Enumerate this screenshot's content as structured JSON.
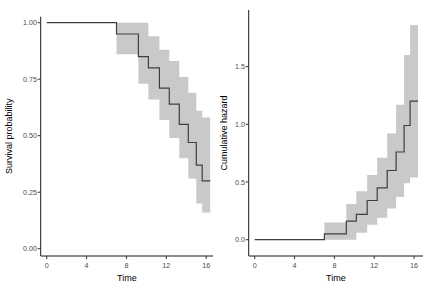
{
  "figure": {
    "width": 436,
    "height": 294,
    "background": "#ffffff"
  },
  "colors": {
    "curve": "#3f3f3f",
    "ribbon": "#c9c9c9",
    "axis_line": "#1a1a1a",
    "tick_mark": "#333333",
    "tick_label": "#4d4d4d",
    "axis_title": "#000000"
  },
  "chart_data": [
    {
      "type": "line",
      "subtype": "kaplan-meier-step",
      "panel": "left",
      "title": "",
      "xlabel": "Time",
      "ylabel": "Survival probability",
      "grid": false,
      "legend": "none",
      "xlim": [
        -0.7,
        16.6
      ],
      "ylim": [
        -0.03,
        1.03
      ],
      "x_tick_values": [
        0,
        4,
        8,
        12,
        16
      ],
      "x_tick_labels": [
        "0",
        "4",
        "8",
        "12",
        "16"
      ],
      "y_tick_values": [
        0.0,
        0.25,
        0.5,
        0.75,
        1.0
      ],
      "y_tick_labels": [
        "0.00",
        "0.25",
        "0.50",
        "0.75",
        "1.00"
      ],
      "start_time": 0,
      "start_value": 1.0,
      "event_times": [
        7.0,
        9.2,
        10.2,
        11.3,
        12.3,
        13.3,
        14.2,
        15.0,
        15.6
      ],
      "values_after_event": [
        0.95,
        0.85,
        0.8,
        0.71,
        0.64,
        0.55,
        0.47,
        0.37,
        0.3
      ],
      "curve_end_time": 16.4,
      "ci_upper": [
        1.0,
        1.0,
        0.94,
        0.88,
        0.83,
        0.76,
        0.69,
        0.61,
        0.58
      ],
      "ci_lower": [
        0.86,
        0.73,
        0.66,
        0.57,
        0.49,
        0.4,
        0.31,
        0.2,
        0.16
      ]
    },
    {
      "type": "line",
      "subtype": "cumulative-hazard-step",
      "panel": "right",
      "title": "",
      "xlabel": "Time",
      "ylabel": "Cumulative hazard",
      "grid": false,
      "legend": "none",
      "xlim": [
        -0.7,
        16.6
      ],
      "ylim": [
        -0.095,
        1.98
      ],
      "x_tick_values": [
        0,
        4,
        8,
        12,
        16
      ],
      "x_tick_labels": [
        "0",
        "4",
        "8",
        "12",
        "16"
      ],
      "y_tick_values": [
        0.0,
        0.5,
        1.0,
        1.5
      ],
      "y_tick_labels": [
        "0.0",
        "0.5",
        "1.0",
        "1.5"
      ],
      "start_time": 0,
      "start_value": 0.0,
      "event_times": [
        7.0,
        9.2,
        10.2,
        11.3,
        12.3,
        13.3,
        14.2,
        15.0,
        15.6
      ],
      "values_after_event": [
        0.05,
        0.16,
        0.22,
        0.34,
        0.45,
        0.6,
        0.76,
        0.99,
        1.2
      ],
      "curve_end_time": 16.4,
      "ci_upper": [
        0.15,
        0.31,
        0.42,
        0.56,
        0.71,
        0.92,
        1.17,
        1.6,
        1.86
      ],
      "ci_lower": [
        0.0,
        0.0,
        0.06,
        0.13,
        0.19,
        0.27,
        0.37,
        0.49,
        0.54
      ]
    }
  ]
}
